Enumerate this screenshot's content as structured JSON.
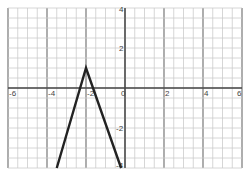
{
  "chart_data": {
    "type": "line",
    "title": "",
    "xlabel": "",
    "ylabel": "",
    "xlim": [
      -6,
      6
    ],
    "ylim": [
      -4,
      4
    ],
    "grid": true,
    "grid_step": 0.5,
    "x_ticks": [
      -6,
      -4,
      -2,
      0,
      2,
      4,
      6
    ],
    "y_ticks": [
      4,
      2,
      0,
      -2,
      -4
    ],
    "x_tick_labels": [
      "-6",
      "-4",
      "-2",
      "0",
      "2",
      "4",
      "6"
    ],
    "y_tick_labels": [
      "4",
      "2",
      "-2",
      "-4"
    ],
    "series": [
      {
        "name": "piecewise line",
        "color": "#222222",
        "points": [
          [
            -3.5,
            -4
          ],
          [
            -2,
            1
          ],
          [
            -0.2,
            -4
          ]
        ]
      }
    ]
  }
}
